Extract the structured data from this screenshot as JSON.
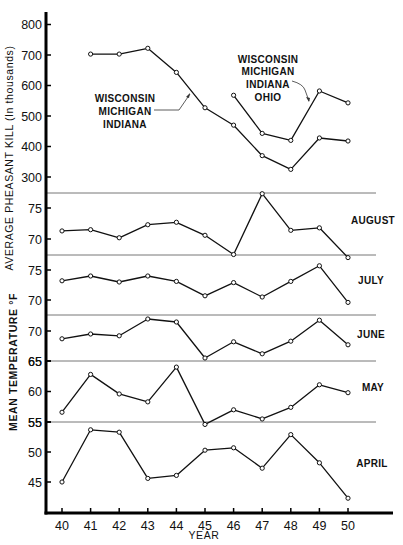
{
  "chart_data": {
    "type": "line",
    "title": "",
    "xlabel": "YEAR",
    "x": [
      40,
      41,
      42,
      43,
      44,
      45,
      46,
      47,
      48,
      49,
      50
    ],
    "x_tick_labels": [
      "40",
      "41",
      "42",
      "43",
      "44",
      "45",
      "46",
      "47",
      "48",
      "49",
      "50"
    ],
    "grid": false,
    "panels": [
      {
        "id": "pheasant-kill",
        "ylabel": "AVERAGE PHEASANT KILL (In thousands)",
        "ylim": [
          250,
          850
        ],
        "y_ticks": [
          300,
          400,
          500,
          600,
          700,
          800
        ],
        "series": [
          {
            "name": "WISCONSIN MICHIGAN INDIANA",
            "label_lines": [
              "WISCONSIN",
              "MICHIGAN",
              "INDIANA"
            ],
            "values": [
              null,
              703,
              703,
              722,
              643,
              527,
              470,
              370,
              325,
              428,
              418
            ]
          },
          {
            "name": "WISCONSIN MICHIGAN INDIANA OHIO",
            "label_lines": [
              "WISCONSIN",
              "MICHIGAN",
              "INDIANA",
              "OHIO"
            ],
            "values": [
              null,
              null,
              null,
              null,
              null,
              null,
              568,
              443,
              420,
              582,
              543
            ]
          }
        ]
      },
      {
        "id": "temp-august",
        "label": "AUGUST",
        "y_ticks": [
          70,
          75
        ],
        "series": [
          {
            "name": "AUGUST",
            "values": [
              71.3,
              71.5,
              70.2,
              72.3,
              72.7,
              70.6,
              67.5,
              77.3,
              71.4,
              71.8,
              67.0
            ]
          }
        ]
      },
      {
        "id": "temp-july",
        "label": "JULY",
        "y_ticks": [
          70,
          75
        ],
        "series": [
          {
            "name": "JULY",
            "values": [
              73.2,
              74.0,
              73.0,
              74.0,
              73.1,
              70.7,
              72.9,
              70.5,
              73.1,
              75.7,
              69.6
            ]
          }
        ]
      },
      {
        "id": "temp-june",
        "label": "JUNE",
        "y_ticks": [
          65,
          70
        ],
        "series": [
          {
            "name": "JUNE",
            "values": [
              68.7,
              69.5,
              69.2,
              72.0,
              71.5,
              65.5,
              68.2,
              66.2,
              68.3,
              71.8,
              67.7
            ]
          }
        ]
      },
      {
        "id": "temp-may",
        "label": "MAY",
        "y_ticks": [
          55,
          60,
          65
        ],
        "series": [
          {
            "name": "MAY",
            "values": [
              56.6,
              62.8,
              59.6,
              58.3,
              64.0,
              54.6,
              57.0,
              55.5,
              57.4,
              61.1,
              59.8
            ]
          }
        ]
      },
      {
        "id": "temp-april",
        "label": "APRIL",
        "y_ticks": [
          45,
          50,
          55
        ],
        "series": [
          {
            "name": "APRIL",
            "values": [
              45.0,
              53.7,
              53.3,
              45.6,
              46.1,
              50.3,
              50.7,
              47.3,
              52.9,
              48.2,
              42.3
            ]
          }
        ]
      }
    ],
    "temperature_ylabel": "MEAN TEMPERATURE °F"
  }
}
